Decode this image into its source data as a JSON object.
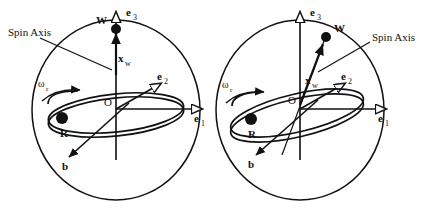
{
  "figure": {
    "type": "vector-diagram",
    "title": "",
    "background_color": "#ffffff",
    "stroke_color": "#111111",
    "panel_count": 2
  },
  "panels": [
    {
      "id": "left",
      "spin_axis_state": "aligned-with-e3",
      "sphere": {
        "cx": 116,
        "cy": 110,
        "rx": 84,
        "ry": 90
      },
      "origin": {
        "label": "O",
        "x": 116,
        "y": 109
      },
      "labels": {
        "spin_axis": "Spin Axis",
        "point_w": "W",
        "point_r": "R",
        "origin": "O",
        "axis_e1": "e",
        "axis_e1_sub": "1",
        "axis_e2": "e",
        "axis_e2_sub": "2",
        "axis_e3": "e",
        "axis_e3_sub": "3",
        "vector_xw": "x",
        "vector_xw_sub": "w",
        "vector_b": "b",
        "omega": "ω",
        "omega_sub": "r"
      }
    },
    {
      "id": "right",
      "spin_axis_state": "tilted-from-e3",
      "sphere": {
        "cx": 300,
        "cy": 110,
        "rx": 84,
        "ry": 90
      },
      "origin": {
        "label": "O",
        "x": 300,
        "y": 105
      },
      "labels": {
        "spin_axis": "Spin Axis",
        "point_w": "W",
        "point_r": "R",
        "origin": "O",
        "axis_e1": "e",
        "axis_e1_sub": "1",
        "axis_e2": "e",
        "axis_e2_sub": "2",
        "axis_e3": "e",
        "axis_e3_sub": "3",
        "vector_xw": "x",
        "vector_xw_sub": "w",
        "vector_b": "b",
        "omega": "ω",
        "omega_sub": "r"
      }
    }
  ]
}
